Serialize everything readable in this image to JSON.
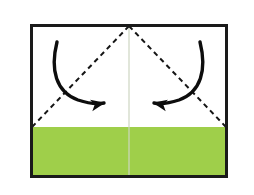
{
  "figure": {
    "kind": "origami-fold-diagram",
    "background_color": "#ffffff"
  },
  "paper": {
    "name": "square-paper-sheet",
    "border_color": "#1a1a1a",
    "border_width_px": 3,
    "face_up_color": "#ffffff",
    "face_down_color": "#9fcf4a",
    "bounds": {
      "x": 30,
      "y": 24,
      "width": 198,
      "height": 154
    }
  },
  "colored_band": {
    "name": "green-lower-band",
    "color": "#9fcf4a",
    "top_y": 127,
    "label": "colored side of paper"
  },
  "center_crease": {
    "name": "vertical-center-crease",
    "color": "#cdd6c2",
    "x": 129,
    "from_y": 24,
    "to_y": 178,
    "style": "solid",
    "width_px": 1.2
  },
  "fold_lines": [
    {
      "name": "left-diagonal-fold-line",
      "style": "dashed",
      "color": "#151515",
      "dash": "5 4",
      "width_px": 2,
      "from": {
        "x": 129,
        "y": 26
      },
      "to": {
        "x": 32,
        "y": 127
      }
    },
    {
      "name": "right-diagonal-fold-line",
      "style": "dashed",
      "color": "#151515",
      "dash": "5 4",
      "width_px": 2,
      "from": {
        "x": 129,
        "y": 26
      },
      "to": {
        "x": 226,
        "y": 127
      }
    }
  ],
  "arrows": [
    {
      "name": "left-fold-arrow",
      "color": "#0d0d0d",
      "direction": "clockwise-down-right",
      "tail": {
        "x": 57,
        "y": 42
      },
      "tip": {
        "x": 112,
        "y": 103
      },
      "path": "M 57 42 C 50 70, 56 92, 78 100 C 90 104, 99 104, 104 103",
      "width_px": 3.4,
      "head_length_px": 13,
      "head_width_px": 11
    },
    {
      "name": "right-fold-arrow",
      "color": "#0d0d0d",
      "direction": "counterclockwise-down-left",
      "tail": {
        "x": 200,
        "y": 42
      },
      "tip": {
        "x": 147,
        "y": 103
      },
      "path": "M 200 42 C 207 70, 201 92, 179 100 C 167 104, 159 104, 154 103",
      "width_px": 3.4,
      "head_length_px": 13,
      "head_width_px": 11
    }
  ],
  "accessibility": {
    "description": "A rectangular sheet of paper outlined in black. The lower portion of the sheet is colored yellow-green; the upper portion is white. A faint vertical crease runs down the middle. Two dashed diagonal fold lines run from the top center point down to the left and right edges where the green begins, forming an inverted V. A curved black arrow on each side points inward toward the center, indicating both upper corners fold down to the middle."
  }
}
